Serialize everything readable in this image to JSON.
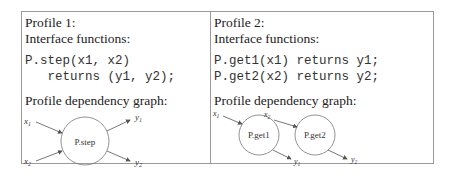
{
  "profiles": [
    {
      "title": "Profile 1:",
      "interface_heading": "Interface functions:",
      "code_lines": [
        "P.step(x1, x2)",
        "   returns (y1, y2);"
      ],
      "graph_heading": "Profile dependency graph:",
      "graph": {
        "nodes": [
          {
            "label": "P.step"
          }
        ],
        "inputs": [
          "x1",
          "x2"
        ],
        "outputs": [
          "y1",
          "y2"
        ]
      }
    },
    {
      "title": "Profile 2:",
      "interface_heading": "Interface functions:",
      "code_lines": [
        "P.get1(x1) returns y1;",
        "P.get2(x2) returns y2;"
      ],
      "graph_heading": "Profile dependency graph:",
      "graph": {
        "nodes": [
          {
            "label": "P.get1"
          },
          {
            "label": "P.get2"
          }
        ],
        "inputs": [
          "x1",
          "x2"
        ],
        "outputs": [
          "y1",
          "y2"
        ]
      }
    }
  ],
  "colors": {
    "border": "#9a9a9a",
    "stroke": "#555555",
    "text": "#222222"
  }
}
